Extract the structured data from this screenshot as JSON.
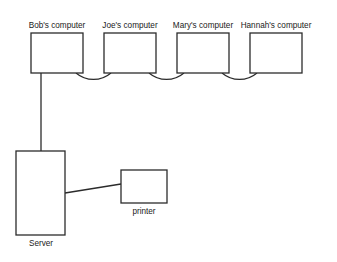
{
  "diagram": {
    "background_color": "#ffffff",
    "stroke_color": "#2b2b2b",
    "nodes": [
      {
        "id": "bob",
        "label": "Bob's computer",
        "label_position": "above",
        "shape": "rectangle",
        "x": 31,
        "y": 33,
        "width": 52,
        "height": 40,
        "label_x": 57,
        "label_y": 28
      },
      {
        "id": "joe",
        "label": "Joe's computer",
        "label_position": "above",
        "shape": "rectangle",
        "x": 104,
        "y": 33,
        "width": 52,
        "height": 40,
        "label_x": 130,
        "label_y": 28
      },
      {
        "id": "mary",
        "label": "Mary's computer",
        "label_position": "above",
        "shape": "rectangle",
        "x": 177,
        "y": 33,
        "width": 52,
        "height": 40,
        "label_x": 203,
        "label_y": 28
      },
      {
        "id": "hannah",
        "label": "Hannah's computer",
        "label_position": "above",
        "shape": "rectangle",
        "x": 250,
        "y": 33,
        "width": 52,
        "height": 40,
        "label_x": 276,
        "label_y": 28
      },
      {
        "id": "server",
        "label": "Server",
        "label_position": "below",
        "shape": "rectangle",
        "x": 16,
        "y": 151,
        "width": 49,
        "height": 84,
        "label_x": 41,
        "label_y": 246
      },
      {
        "id": "printer",
        "label": "printer",
        "label_position": "below",
        "shape": "rectangle",
        "x": 121,
        "y": 170,
        "width": 46,
        "height": 33,
        "label_x": 144,
        "label_y": 214
      }
    ],
    "connections": [
      {
        "id": "bob-joe",
        "type": "arc",
        "from": "bob",
        "to": "joe",
        "path": "M 76 73 A 27 27 0 0 0 111 73"
      },
      {
        "id": "joe-mary",
        "type": "arc",
        "from": "joe",
        "to": "mary",
        "path": "M 149 73 A 27 27 0 0 0 184 73"
      },
      {
        "id": "mary-hannah",
        "type": "arc",
        "from": "mary",
        "to": "hannah",
        "path": "M 222 73 A 27 27 0 0 0 257 73"
      },
      {
        "id": "bob-server",
        "type": "line",
        "from": "bob",
        "to": "server",
        "path": "M 41 73 L 41 151"
      },
      {
        "id": "server-printer",
        "type": "line",
        "from": "server",
        "to": "printer",
        "path": "M 65 193 L 121 184"
      }
    ]
  }
}
